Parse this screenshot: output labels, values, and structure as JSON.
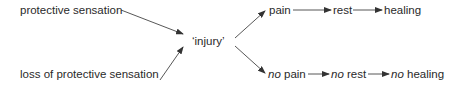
{
  "diagram": {
    "sources": [
      {
        "id": "protective",
        "label": "protective sensation"
      },
      {
        "id": "loss",
        "label": "loss of protective sensation"
      }
    ],
    "center": {
      "id": "injury",
      "label": "‘injury’"
    },
    "top_chain": [
      {
        "label": "pain"
      },
      {
        "label": "rest"
      },
      {
        "label": "healing"
      }
    ],
    "bottom_chain": [
      {
        "prefix": "no",
        "label": "pain"
      },
      {
        "prefix": "no",
        "label": "rest"
      },
      {
        "prefix": "no",
        "label": "healing"
      }
    ],
    "colors": {
      "text": "#2a2a2a",
      "arrow": "#333333",
      "background": "#ffffff"
    }
  }
}
